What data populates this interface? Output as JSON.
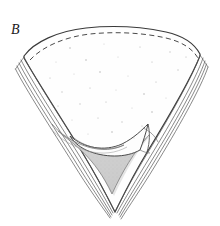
{
  "figure": {
    "panel_label": "B",
    "caption_text": "",
    "background_color": "#ffffff",
    "ink_color": "#2b2b2b",
    "outline_color": "#3a3a3a",
    "lamination_line_color": "#555555",
    "dashed_margin_color": "#4a4a4a",
    "shaded_region_fill": "#cfcfcf",
    "shaded_region_stroke": "#6a6a6a",
    "stipple_dot_color": "#9a9a9a",
    "interior_fill": "#fefefe"
  },
  "illustration": {
    "type": "line-drawing",
    "subject": "fan-shaped laminated valve with folded apical flap",
    "parts": [
      {
        "name": "outer-shell-outline",
        "description": "fan / wedge sector outline, broad convex top arc narrowing to pointed apex at bottom"
      },
      {
        "name": "dashed-growth-margin",
        "description": "dashed arc running just inside the upper convex margin"
      },
      {
        "name": "left-lamination-edge",
        "description": "stack of five parallel thin lines along the left straight edge"
      },
      {
        "name": "right-lamination-edge",
        "description": "stack of five parallel thin lines along the right straight edge"
      },
      {
        "name": "apical-shaded-triangle",
        "description": "gray stippled triangular region filling the lower apex interior"
      },
      {
        "name": "folded-flap",
        "description": "curved tongue-like folded lamella overlapping the shaded triangle"
      },
      {
        "name": "interior-stipple-field",
        "description": "sparse scattered fine dots over the upper interior surface"
      }
    ],
    "geometry": {
      "top_arc_left_x": 22,
      "top_arc_right_x": 202,
      "top_arc_apex_y": 27,
      "left_corner": [
        24,
        56
      ],
      "right_corner": [
        200,
        54
      ],
      "bottom_apex": [
        114,
        213
      ],
      "canvas_width": 220,
      "canvas_height": 226
    },
    "stipple_points": [
      [
        70,
        48
      ],
      [
        104,
        44
      ],
      [
        140,
        47
      ],
      [
        170,
        52
      ],
      [
        186,
        57
      ],
      [
        56,
        62
      ],
      [
        86,
        60
      ],
      [
        118,
        57
      ],
      [
        152,
        62
      ],
      [
        178,
        70
      ],
      [
        50,
        78
      ],
      [
        74,
        74
      ],
      [
        100,
        72
      ],
      [
        128,
        76
      ],
      [
        156,
        82
      ],
      [
        62,
        92
      ],
      [
        90,
        88
      ],
      [
        116,
        90
      ],
      [
        144,
        94
      ],
      [
        166,
        98
      ],
      [
        58,
        106
      ],
      [
        80,
        104
      ],
      [
        106,
        102
      ],
      [
        132,
        108
      ],
      [
        152,
        112
      ],
      [
        72,
        120
      ],
      [
        98,
        118
      ],
      [
        122,
        122
      ],
      [
        142,
        126
      ],
      [
        88,
        134
      ],
      [
        112,
        132
      ],
      [
        134,
        138
      ]
    ]
  }
}
